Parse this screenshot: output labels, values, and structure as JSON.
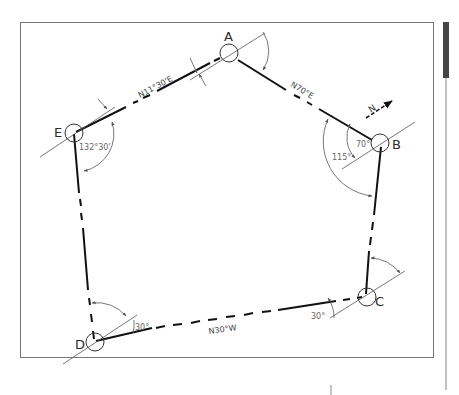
{
  "diagram": {
    "type": "closed traverse (pentagon) survey plot",
    "stations": [
      {
        "id": "A",
        "label": "A"
      },
      {
        "id": "B",
        "label": "B"
      },
      {
        "id": "C",
        "label": "C"
      },
      {
        "id": "D",
        "label": "D"
      },
      {
        "id": "E",
        "label": "E"
      }
    ],
    "bearings": {
      "EA": "N11°30'E",
      "AB": "N70°E",
      "DC": "N30°W"
    },
    "angles": {
      "E_interior": "132°30'",
      "B_deflection": "70°",
      "B_interior": "115°",
      "D_angle": "30°",
      "C_angle": "30°"
    },
    "north_arrow": {
      "label": "N"
    },
    "colors": {
      "line": "#111111",
      "thin_line": "#555555",
      "frame": "#666666",
      "scrollbar_thumb": "#444444"
    }
  }
}
